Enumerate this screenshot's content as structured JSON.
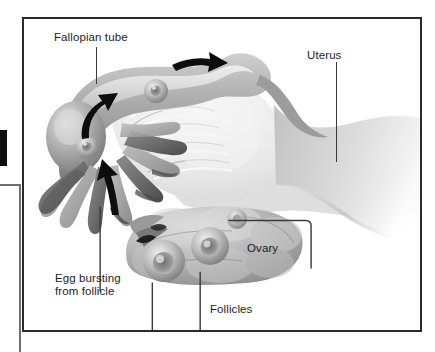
{
  "figure": {
    "frame": {
      "border_color": "#2b2b2b"
    },
    "labels": [
      {
        "id": "fallopian-tube",
        "text": "Fallopian tube"
      },
      {
        "id": "uterus",
        "text": "Uterus"
      },
      {
        "id": "ovary",
        "text": "Ovary"
      },
      {
        "id": "follicles",
        "text": "Follicles"
      },
      {
        "id": "egg-bursting-line1",
        "text": "Egg bursting"
      },
      {
        "id": "egg-bursting-line2",
        "text": "from follicle"
      }
    ],
    "structures": [
      {
        "name": "fallopian-tube",
        "description": "curved tube at upper left"
      },
      {
        "name": "fimbriae",
        "description": "finger-like projections at left end of tube"
      },
      {
        "name": "uterus",
        "description": "large body at centre-right, cut away"
      },
      {
        "name": "ovary",
        "description": "lobed organ below the tube"
      },
      {
        "name": "follicles",
        "description": "round swellings on the ovary surface"
      }
    ],
    "arrows": [
      {
        "id": "arrow-tube-upper-left",
        "meaning": "egg travelling along tube"
      },
      {
        "id": "arrow-tube-upper-right",
        "meaning": "egg travelling toward uterus"
      },
      {
        "id": "arrow-egg-entering",
        "meaning": "egg bursting from follicle into fimbriae"
      }
    ],
    "colors": {
      "ink": "#1d1d1d",
      "leader": "#3a3a3a",
      "border": "#2b2b2b",
      "tissue_dark": "#7d7d7d",
      "tissue_mid": "#a8a8a8",
      "tissue_light": "#d8d8d8",
      "background": "#ffffff"
    }
  },
  "page_edge": {
    "black_block": "page-edge-marker",
    "rule": "page-edge-rule"
  }
}
